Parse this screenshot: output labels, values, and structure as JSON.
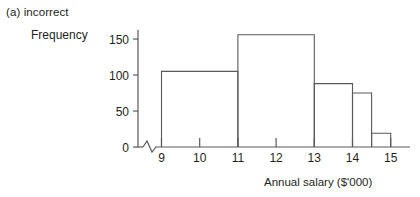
{
  "caption": {
    "text": "(a) incorrect"
  },
  "chart_data": {
    "type": "bar",
    "title": "(a) incorrect",
    "xlabel": "Annual salary ($'000)",
    "ylabel": "Frequency",
    "xlim": [
      9,
      15
    ],
    "ylim": [
      0,
      165
    ],
    "grid": false,
    "legend": null,
    "axis_break_x": true,
    "xticks": [
      "9",
      "10",
      "11",
      "12",
      "13",
      "14",
      "15"
    ],
    "xtick_values": [
      9,
      10,
      11,
      12,
      13,
      14,
      15
    ],
    "yticks": [
      "0",
      "50",
      "100",
      "150"
    ],
    "ytick_values": [
      0,
      50,
      100,
      150
    ],
    "bins": [
      {
        "start": 9,
        "end": 11,
        "value": 105
      },
      {
        "start": 11,
        "end": 13,
        "value": 156
      },
      {
        "start": 13,
        "end": 14,
        "value": 88
      },
      {
        "start": 14,
        "end": 14.5,
        "value": 75
      },
      {
        "start": 14.5,
        "end": 15,
        "value": 19
      }
    ],
    "categories": [
      "9-11",
      "11-13",
      "13-14",
      "14-14.5",
      "14.5-15"
    ],
    "values": [
      105,
      156,
      88,
      75,
      19
    ],
    "colors": {
      "bar_stroke": "#58595b",
      "bar_fill": "none",
      "axis": "#58595b",
      "text": "#231f20"
    }
  }
}
